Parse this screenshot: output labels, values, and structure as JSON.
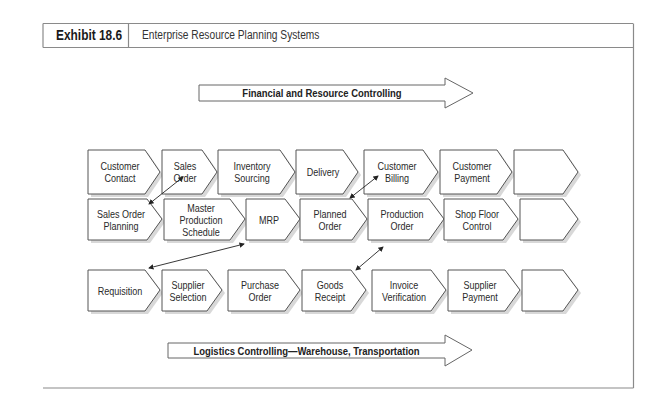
{
  "exhibit": {
    "label": "Exhibit 18.6",
    "title": "Enterprise Resource Planning Systems"
  },
  "bands": {
    "top": "Financial and Resource Controlling",
    "bottom": "Logistics Controlling—Warehouse, Transportation"
  },
  "rows": [
    {
      "name": "sales",
      "steps": [
        {
          "label": "Customer\nContact"
        },
        {
          "label": "Sales\nOrder"
        },
        {
          "label": "Inventory\nSourcing"
        },
        {
          "label": "Delivery"
        },
        {
          "label": "Customer\nBilling"
        },
        {
          "label": "Customer\nPayment"
        },
        {
          "label": ""
        }
      ]
    },
    {
      "name": "production",
      "steps": [
        {
          "label": "Sales Order\nPlanning"
        },
        {
          "label": "Master\nProduction\nSchedule"
        },
        {
          "label": "MRP"
        },
        {
          "label": "Planned\nOrder"
        },
        {
          "label": "Production\nOrder"
        },
        {
          "label": "Shop Floor\nControl"
        },
        {
          "label": ""
        }
      ]
    },
    {
      "name": "procurement",
      "steps": [
        {
          "label": "Requisition"
        },
        {
          "label": "Supplier\nSelection"
        },
        {
          "label": "Purchase\nOrder"
        },
        {
          "label": "Goods\nReceipt"
        },
        {
          "label": "Invoice\nVerification"
        },
        {
          "label": "Supplier\nPayment"
        },
        {
          "label": ""
        }
      ]
    }
  ],
  "links": [
    {
      "from": "Sales Order",
      "to": "Sales Order Planning"
    },
    {
      "from": "Customer Billing",
      "to": "Planned Order"
    },
    {
      "from": "MRP",
      "to": "Requisition"
    },
    {
      "from": "Production Order",
      "to": "Goods Receipt"
    }
  ],
  "colors": {
    "stroke": "#555555",
    "shadow": "#d6d6d6",
    "frame": "#8a8a8a"
  }
}
